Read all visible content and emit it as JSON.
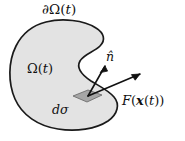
{
  "figure": {
    "type": "math-diagram",
    "background_color": "#ffffff",
    "region": {
      "name": "omega-region",
      "fill_color": "#e3e3e3",
      "stroke_color": "#1a1a1a",
      "stroke_width": 1.6,
      "shape": "bean-with-concave-notch"
    },
    "surface_element": {
      "name": "d-sigma-patch",
      "fill_color": "#a8a8a8",
      "stroke_color": "#5a5a5a",
      "shape": "parallelogram"
    },
    "arrows": {
      "stroke_color": "#111111",
      "stroke_width": 1.5
    }
  },
  "labels": {
    "boundary": {
      "id": "boundary-label",
      "partial": "∂",
      "omega": "Ω",
      "open_paren": "(",
      "t": "t",
      "close_paren": ")",
      "full_text": "∂Ω(t)"
    },
    "domain": {
      "id": "domain-label",
      "omega": "Ω",
      "open_paren": "(",
      "t": "t",
      "close_paren": ")",
      "full_text": "Ω(t)"
    },
    "surface_element": {
      "id": "d-sigma-label",
      "d": "d",
      "sigma": "σ",
      "full_text": "dσ"
    },
    "normal": {
      "id": "unit-normal-label",
      "symbol": "n̂",
      "full_text": "n̂"
    },
    "force": {
      "id": "force-label",
      "F": "F",
      "open_paren": "(",
      "x": "x",
      "open_paren2": "(",
      "t": "t",
      "close_paren2": ")",
      "close_paren": ")",
      "full_text": "F(x(t))"
    }
  }
}
